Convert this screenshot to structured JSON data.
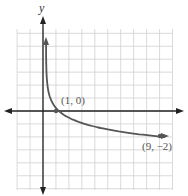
{
  "chart_data": {
    "type": "line",
    "title": "",
    "xlabel": "x",
    "ylabel": "y",
    "xlim": [
      -2,
      10
    ],
    "ylim": [
      -6,
      6
    ],
    "grid": true,
    "series": [
      {
        "name": "y = -log_3(x)",
        "x": [
          0.02,
          0.05,
          0.1,
          0.2,
          0.5,
          1,
          2,
          3,
          4,
          5,
          6,
          7,
          8,
          9
        ],
        "y": [
          3.56,
          2.73,
          2.1,
          1.46,
          0.63,
          0,
          -0.63,
          -1,
          -1.26,
          -1.46,
          -1.63,
          -1.77,
          -1.89,
          -2
        ]
      }
    ],
    "points": [
      {
        "x": 1,
        "y": 0,
        "label": "(1, 0)"
      },
      {
        "x": 9,
        "y": -2,
        "label": "(9, −2)"
      }
    ]
  },
  "labels": {
    "y_axis": "y",
    "x_axis": "x",
    "point1": "(1, 0)",
    "point2": "(9, −2)"
  },
  "colors": {
    "curve": "#555555",
    "grid": "#d0d0d0",
    "axis": "#222222"
  }
}
